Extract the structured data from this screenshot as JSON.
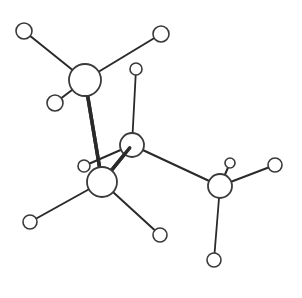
{
  "diagram": {
    "type": "ball-and-stick molecular model",
    "background": "#ffffff",
    "stroke_color": "#2a2a2a",
    "atoms": [
      {
        "id": "H1",
        "kind": "small",
        "x": 24,
        "y": 31,
        "r": 8
      },
      {
        "id": "H2",
        "kind": "small",
        "x": 161,
        "y": 34,
        "r": 8
      },
      {
        "id": "H3",
        "kind": "small",
        "x": 55,
        "y": 103,
        "r": 8
      },
      {
        "id": "H4",
        "kind": "small",
        "x": 136,
        "y": 69,
        "r": 6
      },
      {
        "id": "H5",
        "kind": "small",
        "x": 84,
        "y": 166,
        "r": 6
      },
      {
        "id": "H6",
        "kind": "small",
        "x": 30,
        "y": 222,
        "r": 7
      },
      {
        "id": "H7",
        "kind": "small",
        "x": 160,
        "y": 235,
        "r": 7
      },
      {
        "id": "H8",
        "kind": "small",
        "x": 230,
        "y": 163,
        "r": 5
      },
      {
        "id": "H9",
        "kind": "small",
        "x": 275,
        "y": 165,
        "r": 7
      },
      {
        "id": "H10",
        "kind": "small",
        "x": 214,
        "y": 260,
        "r": 7
      },
      {
        "id": "C4",
        "kind": "large",
        "x": 220,
        "y": 186,
        "r": 12
      },
      {
        "id": "C2",
        "kind": "large",
        "x": 132,
        "y": 145,
        "r": 12
      },
      {
        "id": "C1",
        "kind": "large",
        "x": 85,
        "y": 80,
        "r": 16
      },
      {
        "id": "C3",
        "kind": "large",
        "x": 102,
        "y": 182,
        "r": 15
      }
    ],
    "bonds": [
      {
        "from": "C1",
        "to": "H1",
        "width": 2
      },
      {
        "from": "C1",
        "to": "H2",
        "width": 2
      },
      {
        "from": "C1",
        "to": "H3",
        "width": 2
      },
      {
        "from": "C2",
        "to": "H4",
        "width": 1.8
      },
      {
        "from": "C2",
        "to": "H5",
        "width": 2
      },
      {
        "from": "C2",
        "to": "C4",
        "width": 2.2
      },
      {
        "from": "C4",
        "to": "H8",
        "width": 2
      },
      {
        "from": "C4",
        "to": "H9",
        "width": 2
      },
      {
        "from": "C4",
        "to": "H10",
        "width": 1.8
      },
      {
        "from": "C3",
        "to": "H6",
        "width": 2
      },
      {
        "from": "C3",
        "to": "H7",
        "width": 2
      },
      {
        "from": "C1",
        "to": "C3",
        "width": 3.5
      },
      {
        "from": "C2",
        "to": "C3",
        "width": 3.5
      }
    ]
  }
}
